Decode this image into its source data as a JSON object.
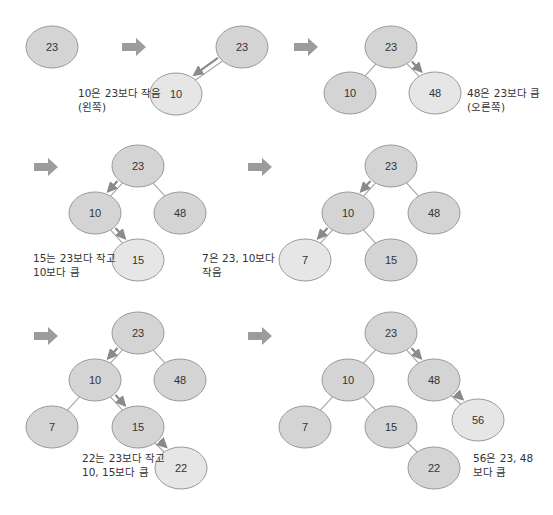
{
  "colors": {
    "node_fill": "#d4d4d4",
    "node_new_fill": "#e6e6e6",
    "node_stroke": "#9a9a9a",
    "edge": "#a8a8a8",
    "step_arrow": "#9c9c9c",
    "path_arrow": "#8a8a8a",
    "text": "#333333"
  },
  "node_size": {
    "rx": 26,
    "ry": 21
  },
  "panels": [
    {
      "id": "step-1",
      "nodes": [
        {
          "label": "23",
          "x": 52,
          "y": 47,
          "new": false
        }
      ],
      "edges": [],
      "path_arrows": [],
      "caption": null
    },
    {
      "id": "step-2",
      "step_arrow": {
        "x": 122,
        "y": 47
      },
      "nodes": [
        {
          "label": "23",
          "x": 242,
          "y": 47,
          "new": false
        },
        {
          "label": "10",
          "x": 176,
          "y": 94,
          "new": true
        }
      ],
      "edges": [
        [
          0,
          1
        ]
      ],
      "path_arrows": [
        [
          0,
          1
        ]
      ],
      "caption": {
        "text": "10은 23보다 작음\n(왼쪽)",
        "x": 78,
        "y": 86
      }
    },
    {
      "id": "step-3",
      "step_arrow": {
        "x": 294,
        "y": 47
      },
      "nodes": [
        {
          "label": "23",
          "x": 391,
          "y": 47,
          "new": false
        },
        {
          "label": "10",
          "x": 350,
          "y": 93,
          "new": false
        },
        {
          "label": "48",
          "x": 435,
          "y": 93,
          "new": true
        }
      ],
      "edges": [
        [
          0,
          1
        ],
        [
          0,
          2
        ]
      ],
      "path_arrows": [
        [
          0,
          2
        ]
      ],
      "caption": {
        "text": "48은 23보다 큼\n(오른쪽)",
        "x": 467,
        "y": 86
      }
    },
    {
      "id": "step-4",
      "step_arrow": {
        "x": 34,
        "y": 167
      },
      "nodes": [
        {
          "label": "23",
          "x": 138,
          "y": 166,
          "new": false
        },
        {
          "label": "10",
          "x": 95,
          "y": 213,
          "new": false
        },
        {
          "label": "48",
          "x": 180,
          "y": 213,
          "new": false
        },
        {
          "label": "15",
          "x": 138,
          "y": 260,
          "new": true
        }
      ],
      "edges": [
        [
          0,
          1
        ],
        [
          0,
          2
        ],
        [
          1,
          3
        ]
      ],
      "path_arrows": [
        [
          0,
          1
        ],
        [
          1,
          3
        ]
      ],
      "caption": {
        "text": "15는 23보다 작고\n10보다 큼",
        "x": 33,
        "y": 251
      }
    },
    {
      "id": "step-5",
      "step_arrow": {
        "x": 248,
        "y": 167
      },
      "nodes": [
        {
          "label": "23",
          "x": 391,
          "y": 166,
          "new": false
        },
        {
          "label": "10",
          "x": 348,
          "y": 213,
          "new": false
        },
        {
          "label": "48",
          "x": 434,
          "y": 213,
          "new": false
        },
        {
          "label": "7",
          "x": 305,
          "y": 260,
          "new": true
        },
        {
          "label": "15",
          "x": 391,
          "y": 260,
          "new": false
        }
      ],
      "edges": [
        [
          0,
          1
        ],
        [
          0,
          2
        ],
        [
          1,
          3
        ],
        [
          1,
          4
        ]
      ],
      "path_arrows": [
        [
          0,
          1
        ],
        [
          1,
          3
        ]
      ],
      "caption": {
        "text": "7은 23, 10보다\n작음",
        "x": 202,
        "y": 251
      }
    },
    {
      "id": "step-6",
      "step_arrow": {
        "x": 34,
        "y": 336
      },
      "nodes": [
        {
          "label": "23",
          "x": 138,
          "y": 333,
          "new": false
        },
        {
          "label": "10",
          "x": 95,
          "y": 380,
          "new": false
        },
        {
          "label": "48",
          "x": 180,
          "y": 380,
          "new": false
        },
        {
          "label": "7",
          "x": 52,
          "y": 427,
          "new": false
        },
        {
          "label": "15",
          "x": 138,
          "y": 427,
          "new": false
        },
        {
          "label": "22",
          "x": 181,
          "y": 468,
          "new": true
        }
      ],
      "edges": [
        [
          0,
          1
        ],
        [
          0,
          2
        ],
        [
          1,
          3
        ],
        [
          1,
          4
        ],
        [
          4,
          5
        ]
      ],
      "path_arrows": [
        [
          0,
          1
        ],
        [
          1,
          4
        ],
        [
          4,
          5
        ]
      ],
      "caption": {
        "text": "22는 23보다 작고\n10, 15보다 큼",
        "x": 82,
        "y": 451
      }
    },
    {
      "id": "step-7",
      "step_arrow": {
        "x": 248,
        "y": 336
      },
      "nodes": [
        {
          "label": "23",
          "x": 391,
          "y": 333,
          "new": false
        },
        {
          "label": "10",
          "x": 348,
          "y": 380,
          "new": false
        },
        {
          "label": "48",
          "x": 434,
          "y": 380,
          "new": false
        },
        {
          "label": "7",
          "x": 305,
          "y": 427,
          "new": false
        },
        {
          "label": "15",
          "x": 391,
          "y": 427,
          "new": false
        },
        {
          "label": "22",
          "x": 434,
          "y": 468,
          "new": false
        },
        {
          "label": "56",
          "x": 478,
          "y": 420,
          "new": true
        }
      ],
      "edges": [
        [
          0,
          1
        ],
        [
          0,
          2
        ],
        [
          1,
          3
        ],
        [
          1,
          4
        ],
        [
          4,
          5
        ],
        [
          2,
          6
        ]
      ],
      "path_arrows": [
        [
          0,
          2
        ],
        [
          2,
          6
        ]
      ],
      "caption": {
        "text": "56은 23, 48\n보다 큼",
        "x": 473,
        "y": 451
      }
    }
  ]
}
